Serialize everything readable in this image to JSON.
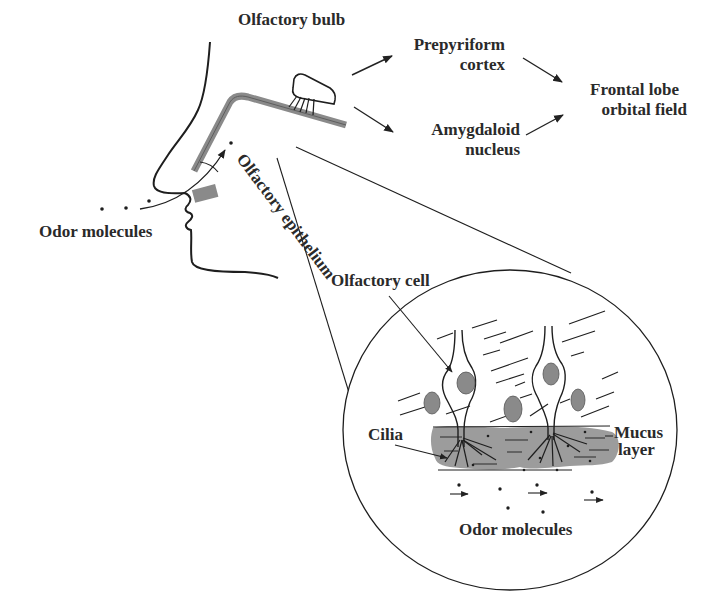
{
  "diagram": {
    "type": "anatomical-illustration",
    "labels": {
      "olfactory_bulb": "Olfactory bulb",
      "prepyriform_line1": "Prepyriform",
      "prepyriform_line2": "cortex",
      "amygdaloid_line1": "Amygdaloid",
      "amygdaloid_line2": "nucleus",
      "frontal_line1": "Frontal lobe",
      "frontal_line2": "orbital field",
      "olfactory_epithelium": "Olfactory epithelium",
      "odor_molecules_outer": "Odor molecules",
      "olfactory_cell": "Olfactory cell",
      "cilia": "Cilia",
      "mucus_line1": "Mucus",
      "mucus_line2": "layer",
      "odor_molecules_inner": "Odor molecules"
    },
    "pathway": [
      {
        "from": "Olfactory bulb",
        "to": "Prepyriform cortex"
      },
      {
        "from": "Olfactory bulb",
        "to": "Amygdaloid nucleus"
      },
      {
        "from": "Prepyriform cortex",
        "to": "Frontal lobe orbital field"
      },
      {
        "from": "Amygdaloid nucleus",
        "to": "Frontal lobe orbital field"
      }
    ],
    "colors": {
      "ink": "#1e1e1e",
      "gray_fill": "#8a8a8a",
      "mucus_fill": "#9c9c9c",
      "background": "#ffffff"
    }
  }
}
